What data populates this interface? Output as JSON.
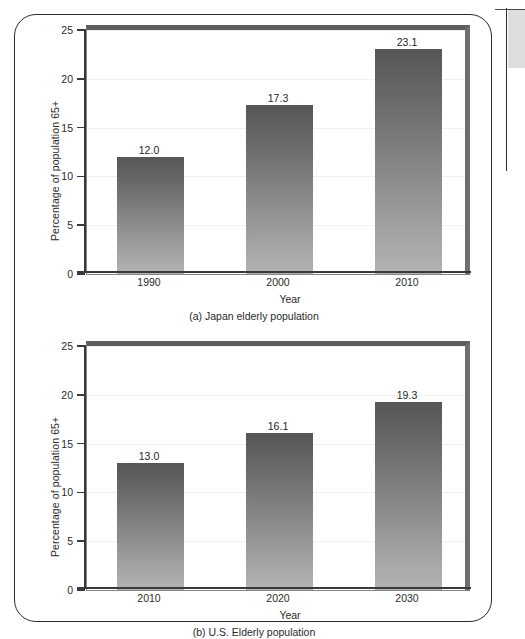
{
  "page": {
    "artifacts": {
      "edge_line": "page-edge-vertical-rule",
      "edge_block": "page-edge-grey-block"
    }
  },
  "figures": [
    {
      "id": "a",
      "caption": "(a) Japan elderly population",
      "chart_data": {
        "type": "bar",
        "title": "(a) Japan elderly population",
        "categories": [
          "1990",
          "2000",
          "2010"
        ],
        "values": [
          12.0,
          17.3,
          23.1
        ],
        "value_labels": [
          "12.0",
          "17.3",
          "23.1"
        ],
        "xlabel": "Year",
        "ylabel": "Percentage of population 65+",
        "ylim": [
          0,
          25
        ],
        "yticks": [
          0,
          5,
          10,
          15,
          20,
          25
        ],
        "ytick_labels": [
          "0",
          "5",
          "10",
          "15",
          "20",
          "25"
        ],
        "grid": true,
        "legend": false,
        "bar_color": "#8e8e8e"
      }
    },
    {
      "id": "b",
      "caption": "(b) U.S. Elderly population",
      "chart_data": {
        "type": "bar",
        "title": "(b) U.S. Elderly population",
        "categories": [
          "2010",
          "2020",
          "2030"
        ],
        "values": [
          13.0,
          16.1,
          19.3
        ],
        "value_labels": [
          "13.0",
          "16.1",
          "19.3"
        ],
        "xlabel": "Year",
        "ylabel": "Percentage of population 65+",
        "ylim": [
          0,
          25
        ],
        "yticks": [
          0,
          5,
          10,
          15,
          20,
          25
        ],
        "ytick_labels": [
          "0",
          "5",
          "10",
          "15",
          "20",
          "25"
        ],
        "grid": true,
        "legend": false,
        "bar_color": "#8e8e8e"
      }
    }
  ]
}
